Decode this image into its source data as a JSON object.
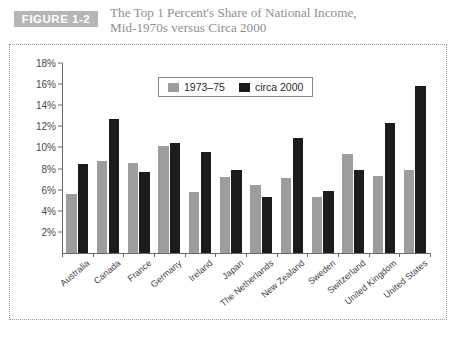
{
  "header": {
    "badge": "FIGURE 1-2",
    "title_line1": "The Top 1 Percent's Share of National Income,",
    "title_line2": "Mid-1970s versus Circa 2000"
  },
  "colors": {
    "badge_bg": "#b6b6b6",
    "title": "#8f8f8f",
    "series_1973_75": "#9d9d9d",
    "series_circa_2000": "#1c1c1c",
    "axis": "#6a6a6a",
    "panel_border": "#9a9a9a"
  },
  "source": {
    "text": ""
  },
  "chart_data": {
    "type": "bar",
    "title": "The Top 1 Percent's Share of National Income, Mid-1970s versus Circa 2000",
    "xlabel": "",
    "ylabel": "",
    "ylim": [
      0,
      18
    ],
    "yticks": [
      "2%",
      "4%",
      "6%",
      "8%",
      "10%",
      "12%",
      "14%",
      "16%",
      "18%"
    ],
    "ytick_values": [
      2,
      4,
      6,
      8,
      10,
      12,
      14,
      16,
      18
    ],
    "grid": false,
    "legend_position": "top-center",
    "categories": [
      "Australia",
      "Canada",
      "France",
      "Germany",
      "Ireland",
      "Japan",
      "The Netherlands",
      "New Zealand",
      "Sweden",
      "Switzerland",
      "United Kingdom",
      "United States"
    ],
    "series": [
      {
        "name": "1973–75",
        "color": "#9d9d9d",
        "values": [
          5.6,
          8.75,
          8.55,
          10.15,
          5.8,
          7.2,
          6.45,
          7.15,
          5.3,
          9.4,
          7.3,
          7.9
        ]
      },
      {
        "name": "circa 2000",
        "color": "#1c1c1c",
        "values": [
          8.4,
          12.7,
          7.65,
          10.4,
          9.6,
          7.85,
          5.3,
          10.85,
          5.9,
          7.85,
          12.35,
          15.8
        ]
      }
    ]
  }
}
